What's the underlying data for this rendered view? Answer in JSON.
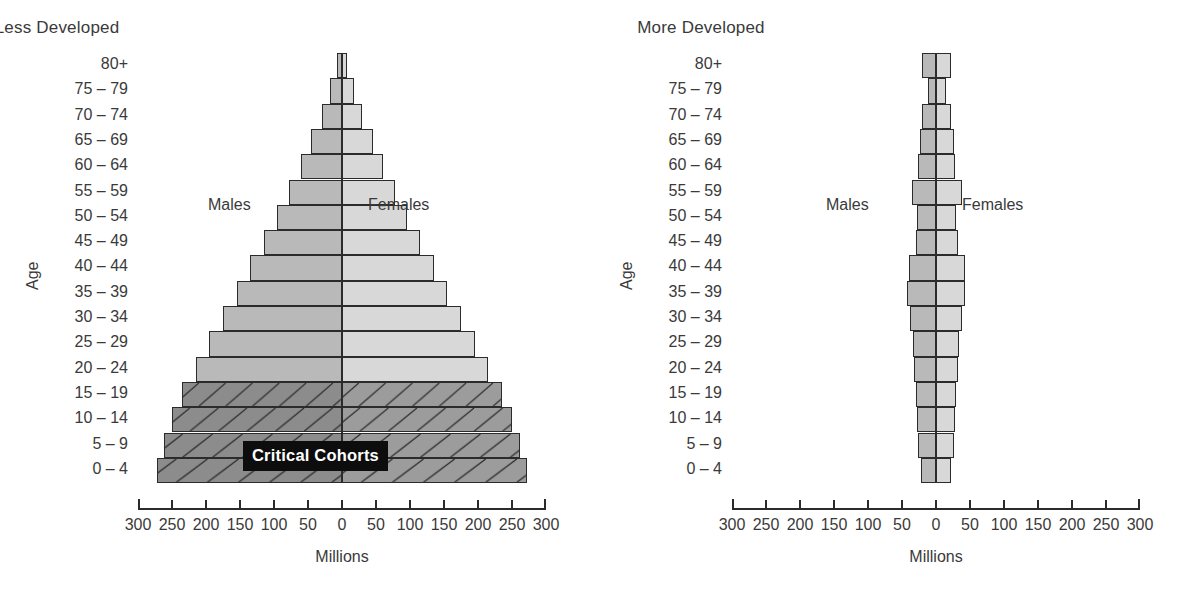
{
  "figure": {
    "x_axis_title": "Millions",
    "y_axis_title": "Age",
    "male_label": "Males",
    "female_label": "Females",
    "callout_label": "Critical Cohorts",
    "tick_labels": [
      "300",
      "250",
      "200",
      "150",
      "100",
      "50",
      "0",
      "50",
      "100",
      "150",
      "200",
      "250",
      "300"
    ],
    "age_groups": [
      "80+",
      "75 – 79",
      "70 – 74",
      "65 – 69",
      "60 – 64",
      "55 – 59",
      "50 – 54",
      "45 – 49",
      "40 – 44",
      "35 – 39",
      "30 – 34",
      "25 – 29",
      "20 – 24",
      "15 – 19",
      "10 – 14",
      "5 – 9",
      "0 – 4"
    ],
    "colors": {
      "male_fill": "#b9b9b9",
      "female_fill": "#d8d8d8",
      "male_fill_critical": "#8c8c8c",
      "female_fill_critical": "#9c9c9c",
      "stroke": "#2b2b2b",
      "callout_bg": "#0d0d0d",
      "callout_text": "#ffffff",
      "text": "#3a3a3a",
      "background": "#ffffff"
    }
  },
  "chart_data": [
    {
      "type": "bar",
      "subtype": "population-pyramid",
      "title": "Less Developed",
      "xlabel": "Millions",
      "ylabel": "Age",
      "xlim": [
        -300,
        300
      ],
      "xticks": [
        -300,
        -250,
        -200,
        -150,
        -100,
        -50,
        0,
        50,
        100,
        150,
        200,
        250,
        300
      ],
      "xticklabels": [
        "300",
        "250",
        "200",
        "150",
        "100",
        "50",
        "0",
        "50",
        "100",
        "150",
        "200",
        "250",
        "300"
      ],
      "grid": false,
      "legend": [
        "Males",
        "Females"
      ],
      "legend_position": "inside-upper",
      "categories": [
        "80+",
        "75 – 79",
        "70 – 74",
        "65 – 69",
        "60 – 64",
        "55 – 59",
        "50 – 54",
        "45 – 49",
        "40 – 44",
        "35 – 39",
        "30 – 34",
        "25 – 29",
        "20 – 24",
        "15 – 19",
        "10 – 14",
        "5 – 9",
        "0 – 4"
      ],
      "series": [
        {
          "name": "Males",
          "side": "left",
          "values": [
            8,
            18,
            30,
            45,
            60,
            78,
            95,
            115,
            135,
            155,
            175,
            195,
            215,
            235,
            250,
            262,
            272
          ]
        },
        {
          "name": "Females",
          "side": "right",
          "values": [
            8,
            18,
            30,
            45,
            60,
            78,
            95,
            115,
            135,
            155,
            175,
            195,
            215,
            235,
            250,
            262,
            272
          ]
        }
      ],
      "annotations": [
        {
          "text": "Critical Cohorts",
          "applies_to": [
            "15 – 19",
            "10 – 14",
            "5 – 9",
            "0 – 4"
          ],
          "style": "black-box-white-bold"
        }
      ]
    },
    {
      "type": "bar",
      "subtype": "population-pyramid",
      "title": "More Developed",
      "xlabel": "Millions",
      "ylabel": "Age",
      "xlim": [
        -300,
        300
      ],
      "xticks": [
        -300,
        -250,
        -200,
        -150,
        -100,
        -50,
        0,
        50,
        100,
        150,
        200,
        250,
        300
      ],
      "xticklabels": [
        "300",
        "250",
        "200",
        "150",
        "100",
        "50",
        "0",
        "50",
        "100",
        "150",
        "200",
        "250",
        "300"
      ],
      "grid": false,
      "legend": [
        "Males",
        "Females"
      ],
      "legend_position": "inside-upper",
      "categories": [
        "80+",
        "75 – 79",
        "70 – 74",
        "65 – 69",
        "60 – 64",
        "55 – 59",
        "50 – 54",
        "45 – 49",
        "40 – 44",
        "35 – 39",
        "30 – 34",
        "25 – 29",
        "20 – 24",
        "15 – 19",
        "10 – 14",
        "5 – 9",
        "0 – 4"
      ],
      "series": [
        {
          "name": "Males",
          "side": "left",
          "values": [
            20,
            12,
            20,
            24,
            26,
            36,
            28,
            30,
            40,
            42,
            38,
            34,
            32,
            30,
            28,
            26,
            22
          ]
        },
        {
          "name": "Females",
          "side": "right",
          "values": [
            22,
            14,
            22,
            26,
            28,
            38,
            30,
            32,
            42,
            42,
            38,
            34,
            32,
            30,
            28,
            26,
            22
          ]
        }
      ],
      "annotations": []
    }
  ]
}
